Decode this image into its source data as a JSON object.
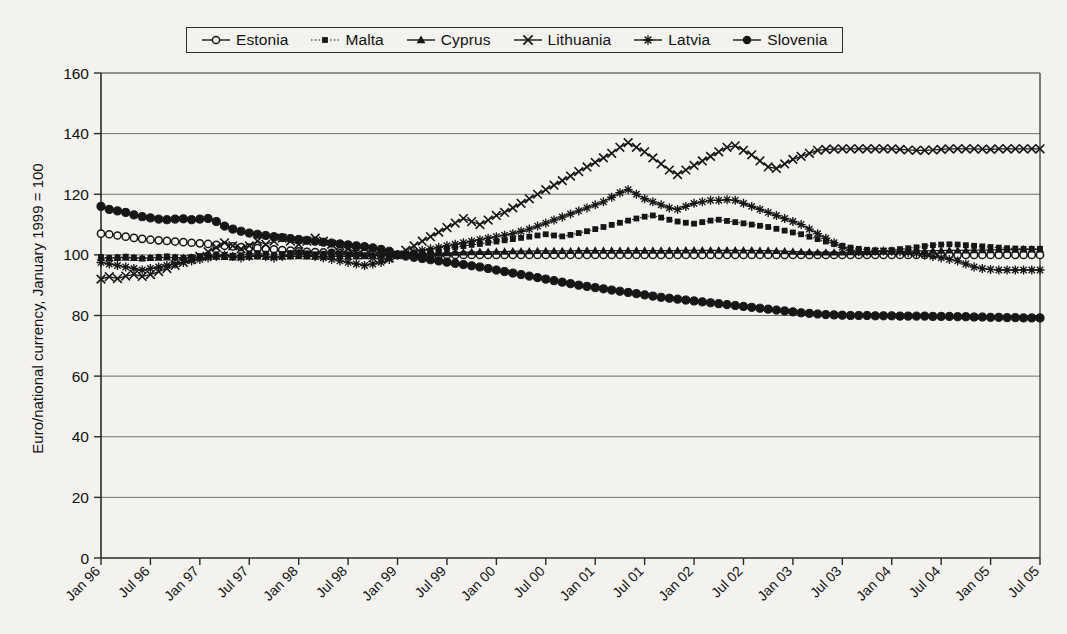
{
  "chart_data": {
    "type": "line",
    "title": "",
    "xlabel": "",
    "ylabel": "Euro/national currency, January 1999 = 100",
    "ylim": [
      0,
      160
    ],
    "yticks": [
      0,
      20,
      40,
      60,
      80,
      100,
      120,
      140,
      160
    ],
    "grid": true,
    "legend_position": "top",
    "x_tick_labels": [
      "Jan 96",
      "Jul 96",
      "Jan 97",
      "Jul 97",
      "Jan 98",
      "Jul 98",
      "Jan 99",
      "Jul 99",
      "Jan 00",
      "Jul 00",
      "Jan 01",
      "Jul 01",
      "Jan 02",
      "Jul 02",
      "Jan 03",
      "Jul 03",
      "Jan 04",
      "Jul 04",
      "Jan 05",
      "Jul 05"
    ],
    "x_tick_interval_months": 6,
    "x_start": "Jan 96",
    "x_end": "Jul 05",
    "n_points": 115,
    "series": [
      {
        "name": "Estonia",
        "marker": "open-circle",
        "line": "solid",
        "values": [
          107.0,
          106.8,
          106.4,
          106.0,
          105.6,
          105.3,
          105.0,
          104.8,
          104.6,
          104.4,
          104.2,
          104.0,
          103.8,
          103.6,
          103.3,
          103.0,
          102.8,
          102.6,
          102.4,
          102.2,
          102.0,
          101.8,
          101.6,
          101.4,
          101.2,
          101.0,
          100.9,
          100.8,
          100.7,
          100.6,
          100.6,
          100.5,
          100.5,
          100.4,
          100.3,
          100.2,
          100.0,
          100.0,
          100.0,
          100.0,
          100.0,
          100.0,
          100.0,
          100.0,
          100.0,
          100.0,
          100.0,
          100.0,
          100.0,
          100.0,
          100.0,
          100.0,
          100.0,
          100.0,
          100.0,
          100.0,
          100.0,
          100.0,
          100.0,
          100.0,
          100.0,
          100.0,
          100.0,
          100.0,
          100.0,
          100.0,
          100.0,
          100.0,
          100.0,
          100.0,
          100.0,
          100.0,
          100.0,
          100.0,
          100.0,
          100.0,
          100.0,
          100.0,
          100.0,
          100.0,
          100.0,
          100.0,
          100.0,
          100.0,
          100.0,
          100.0,
          100.0,
          100.0,
          100.0,
          100.0,
          100.0,
          100.0,
          100.0,
          100.0,
          100.0,
          100.0,
          100.0,
          100.0,
          100.0,
          100.0,
          100.0,
          100.0,
          100.0,
          100.0,
          100.0,
          100.0,
          100.0,
          100.0,
          100.0,
          100.0,
          100.0,
          100.0,
          100.0,
          100.0,
          100.0
        ]
      },
      {
        "name": "Malta",
        "marker": "small-square",
        "line": "dotted",
        "values": [
          99.3,
          99.0,
          99.2,
          99.4,
          99.1,
          98.8,
          99.0,
          99.3,
          99.5,
          99.2,
          99.0,
          99.3,
          99.6,
          99.9,
          100.2,
          100.0,
          99.7,
          99.9,
          100.3,
          100.6,
          100.4,
          100.1,
          100.3,
          100.6,
          100.8,
          100.5,
          100.2,
          100.4,
          100.7,
          100.5,
          100.2,
          100.0,
          99.8,
          99.9,
          100.1,
          100.0,
          100.0,
          100.3,
          100.7,
          101.0,
          101.4,
          101.8,
          102.2,
          102.5,
          102.9,
          103.3,
          103.6,
          104.0,
          104.4,
          104.8,
          105.2,
          105.6,
          106.0,
          106.4,
          106.8,
          106.4,
          106.1,
          106.6,
          107.2,
          107.8,
          108.5,
          109.2,
          109.9,
          110.6,
          111.3,
          112.0,
          112.6,
          113.0,
          112.3,
          111.6,
          111.0,
          110.6,
          110.3,
          110.8,
          111.3,
          111.6,
          111.2,
          110.8,
          110.4,
          110.0,
          109.6,
          109.2,
          108.6,
          108.0,
          107.4,
          106.8,
          106.0,
          105.2,
          104.4,
          103.6,
          103.0,
          102.4,
          102.0,
          101.7,
          101.5,
          101.4,
          101.6,
          101.9,
          102.2,
          102.5,
          102.9,
          103.2,
          103.4,
          103.5,
          103.4,
          103.2,
          103.0,
          102.8,
          102.6,
          102.4,
          102.2,
          102.1,
          102.0,
          102.0,
          102.0
        ]
      },
      {
        "name": "Cyprus",
        "marker": "triangle",
        "line": "solid",
        "values": [
          99.0,
          98.9,
          99.0,
          99.1,
          99.0,
          98.9,
          99.0,
          99.1,
          99.2,
          99.1,
          99.0,
          99.1,
          99.2,
          99.3,
          99.4,
          99.3,
          99.2,
          99.3,
          99.4,
          99.5,
          99.4,
          99.3,
          99.4,
          99.5,
          99.6,
          99.5,
          99.4,
          99.5,
          99.6,
          99.5,
          99.4,
          99.5,
          99.6,
          99.7,
          99.8,
          99.9,
          100.0,
          100.1,
          100.2,
          100.3,
          100.4,
          100.5,
          100.6,
          100.7,
          100.8,
          100.9,
          101.0,
          101.0,
          101.1,
          101.1,
          101.2,
          101.2,
          101.2,
          101.3,
          101.3,
          101.3,
          101.3,
          101.3,
          101.4,
          101.4,
          101.4,
          101.4,
          101.4,
          101.4,
          101.4,
          101.4,
          101.4,
          101.4,
          101.4,
          101.4,
          101.4,
          101.5,
          101.5,
          101.5,
          101.5,
          101.5,
          101.5,
          101.5,
          101.5,
          101.5,
          101.4,
          101.4,
          101.3,
          101.2,
          101.1,
          101.0,
          100.9,
          100.8,
          100.8,
          100.8,
          100.8,
          100.9,
          100.9,
          101.0,
          101.0,
          101.1,
          101.1,
          101.2,
          101.2,
          101.3,
          101.3,
          101.4,
          101.4,
          101.5,
          101.5,
          101.5,
          101.6,
          101.6,
          101.6,
          101.7,
          101.7,
          101.7,
          101.8,
          101.8,
          101.8
        ]
      },
      {
        "name": "Lithuania",
        "marker": "x",
        "line": "solid",
        "values": [
          92.0,
          92.8,
          92.2,
          93.0,
          93.6,
          92.9,
          93.5,
          94.5,
          95.5,
          96.5,
          97.5,
          98.5,
          99.5,
          101.0,
          102.5,
          104.0,
          103.0,
          102.0,
          103.0,
          104.5,
          103.5,
          104.5,
          105.5,
          104.5,
          103.5,
          104.5,
          105.5,
          104.5,
          103.5,
          103.0,
          102.0,
          101.0,
          100.0,
          99.0,
          98.5,
          99.0,
          100.0,
          101.5,
          103.0,
          104.5,
          106.0,
          107.5,
          109.0,
          110.5,
          112.0,
          111.0,
          110.0,
          111.5,
          113.0,
          114.0,
          115.5,
          117.0,
          118.5,
          120.0,
          121.5,
          123.0,
          124.5,
          126.0,
          127.5,
          129.0,
          130.5,
          132.0,
          133.5,
          135.5,
          137.0,
          135.5,
          134.0,
          132.0,
          130.0,
          128.0,
          126.5,
          128.0,
          129.5,
          131.0,
          132.5,
          134.0,
          135.5,
          136.0,
          134.5,
          133.0,
          131.0,
          129.0,
          128.5,
          130.0,
          131.5,
          132.5,
          133.5,
          134.5,
          134.8,
          134.9,
          135.0,
          135.0,
          135.0,
          135.0,
          135.0,
          135.0,
          135.0,
          134.8,
          134.6,
          134.5,
          134.5,
          134.6,
          134.8,
          135.0,
          135.0,
          135.0,
          135.0,
          134.9,
          134.8,
          135.0,
          135.0,
          135.0,
          135.0,
          135.0,
          135.0
        ]
      },
      {
        "name": "Latvia",
        "marker": "asterisk",
        "line": "solid",
        "values": [
          97.5,
          97.0,
          96.5,
          96.0,
          95.5,
          95.0,
          95.5,
          96.0,
          96.5,
          97.0,
          97.5,
          98.0,
          98.5,
          99.0,
          99.5,
          100.0,
          99.5,
          99.0,
          99.5,
          100.0,
          99.5,
          99.0,
          99.5,
          100.0,
          100.5,
          100.0,
          99.5,
          99.0,
          98.5,
          98.0,
          97.5,
          97.0,
          96.5,
          97.0,
          97.5,
          98.5,
          100.0,
          100.5,
          101.0,
          101.5,
          102.0,
          102.5,
          103.0,
          103.5,
          104.0,
          104.5,
          105.0,
          105.5,
          106.0,
          106.5,
          107.0,
          107.8,
          108.5,
          109.5,
          110.5,
          111.5,
          112.5,
          113.5,
          114.5,
          115.5,
          116.5,
          117.5,
          119.0,
          120.5,
          121.5,
          120.0,
          118.5,
          117.5,
          116.5,
          115.5,
          115.0,
          116.0,
          117.0,
          117.5,
          118.0,
          118.0,
          118.2,
          118.0,
          117.0,
          116.0,
          115.0,
          114.0,
          113.0,
          112.0,
          111.0,
          110.0,
          108.5,
          107.0,
          105.5,
          104.0,
          102.5,
          101.5,
          101.0,
          101.0,
          101.2,
          101.3,
          101.2,
          101.0,
          100.8,
          100.5,
          100.0,
          99.5,
          99.0,
          98.5,
          98.0,
          97.0,
          96.0,
          95.5,
          95.2,
          95.0,
          95.0,
          95.0,
          95.0,
          95.0,
          95.0
        ]
      },
      {
        "name": "Slovenia",
        "marker": "filled-circle",
        "line": "solid",
        "values": [
          116.0,
          115.0,
          114.5,
          114.0,
          113.2,
          112.6,
          112.2,
          111.8,
          111.6,
          111.8,
          111.9,
          111.6,
          111.8,
          112.0,
          111.0,
          109.5,
          108.5,
          107.8,
          107.2,
          106.8,
          106.4,
          106.0,
          105.7,
          105.4,
          105.1,
          104.8,
          104.5,
          104.2,
          103.9,
          103.6,
          103.3,
          103.0,
          102.7,
          102.3,
          101.8,
          101.2,
          100.0,
          99.6,
          99.2,
          98.8,
          98.4,
          98.0,
          97.6,
          97.2,
          96.8,
          96.4,
          96.0,
          95.5,
          95.0,
          94.5,
          94.0,
          93.5,
          93.0,
          92.5,
          92.0,
          91.5,
          91.0,
          90.5,
          90.0,
          89.6,
          89.2,
          88.8,
          88.4,
          88.0,
          87.6,
          87.2,
          86.8,
          86.4,
          86.0,
          85.7,
          85.4,
          85.1,
          84.8,
          84.5,
          84.2,
          83.9,
          83.6,
          83.3,
          83.0,
          82.7,
          82.4,
          82.1,
          81.8,
          81.5,
          81.2,
          80.9,
          80.7,
          80.5,
          80.3,
          80.2,
          80.1,
          80.0,
          80.0,
          80.0,
          79.9,
          79.9,
          79.9,
          79.8,
          79.8,
          79.8,
          79.8,
          79.7,
          79.7,
          79.7,
          79.6,
          79.6,
          79.5,
          79.5,
          79.4,
          79.4,
          79.3,
          79.3,
          79.2,
          79.2,
          79.2
        ]
      }
    ]
  },
  "legend": {
    "items": [
      {
        "label": "Estonia",
        "marker": "open-circle",
        "line": "solid"
      },
      {
        "label": "Malta",
        "marker": "small-square",
        "line": "dotted"
      },
      {
        "label": "Cyprus",
        "marker": "triangle",
        "line": "solid"
      },
      {
        "label": "Lithuania",
        "marker": "x",
        "line": "solid"
      },
      {
        "label": "Latvia",
        "marker": "asterisk",
        "line": "solid"
      },
      {
        "label": "Slovenia",
        "marker": "filled-circle",
        "line": "solid"
      }
    ]
  },
  "colors": {
    "ink": "#161616",
    "grid": "#6f6f6f",
    "axis": "#2a2a2a",
    "background": "#f3f2ef"
  }
}
